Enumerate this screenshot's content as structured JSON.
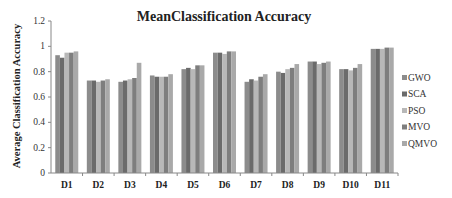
{
  "chart_data": {
    "type": "bar",
    "title": "MeanClassification Accuracy",
    "xlabel": "",
    "ylabel": "Average Classification Accuracy",
    "ylim": [
      0,
      1.2
    ],
    "yticks": [
      0,
      0.2,
      0.4,
      0.6,
      0.8,
      1,
      1.2
    ],
    "ytick_labels": [
      "0",
      "0.2",
      "0.4",
      "0.6",
      "0.8",
      "1",
      "1.2"
    ],
    "grid": false,
    "legend_position": "right",
    "categories": [
      "D1",
      "D2",
      "D3",
      "D4",
      "D5",
      "D6",
      "D7",
      "D8",
      "D9",
      "D10",
      "D11"
    ],
    "series": [
      {
        "name": "GWO",
        "color": "#8c8c8c",
        "values": [
          0.93,
          0.73,
          0.72,
          0.77,
          0.82,
          0.95,
          0.72,
          0.8,
          0.88,
          0.82,
          0.98
        ]
      },
      {
        "name": "SCA",
        "color": "#6b6b6b",
        "values": [
          0.91,
          0.73,
          0.73,
          0.76,
          0.83,
          0.95,
          0.74,
          0.79,
          0.88,
          0.82,
          0.98
        ]
      },
      {
        "name": "PSO",
        "color": "#b8b8b8",
        "values": [
          0.95,
          0.72,
          0.74,
          0.76,
          0.82,
          0.94,
          0.73,
          0.82,
          0.86,
          0.81,
          0.98
        ]
      },
      {
        "name": "MVO",
        "color": "#7e7e7e",
        "values": [
          0.95,
          0.73,
          0.75,
          0.76,
          0.85,
          0.96,
          0.76,
          0.83,
          0.87,
          0.83,
          0.99
        ]
      },
      {
        "name": "QMVO",
        "color": "#a9a9a9",
        "values": [
          0.96,
          0.74,
          0.87,
          0.78,
          0.85,
          0.96,
          0.78,
          0.86,
          0.88,
          0.86,
          0.99
        ]
      }
    ]
  }
}
